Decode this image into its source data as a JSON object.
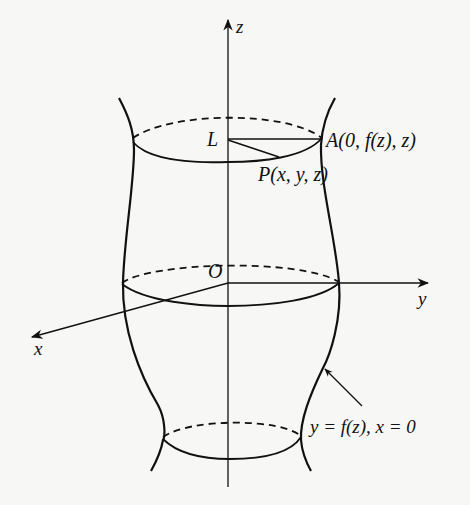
{
  "figure": {
    "type": "surface-of-revolution-diagram",
    "axes": {
      "z": {
        "label": "z"
      },
      "y": {
        "label": "y"
      },
      "x": {
        "label": "x"
      },
      "origin": {
        "label": "O"
      }
    },
    "points": {
      "L": {
        "label": "L"
      },
      "A": {
        "label": "A(0, f(z), z)"
      },
      "P": {
        "label": "P(x, y, z)"
      }
    },
    "curve_annotation": {
      "label": "y = f(z), x = 0"
    },
    "colors": {
      "ink": "#111111",
      "paper": "#f7f7f5"
    }
  }
}
